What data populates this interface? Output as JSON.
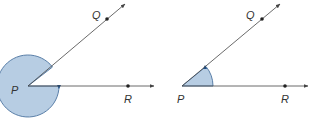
{
  "colors": {
    "fill": "#b7cde3",
    "stroke": "#5a7fa8",
    "line": "#444444",
    "arrow": "#1f4f86"
  },
  "figures": [
    {
      "name": "reflex-angle",
      "labels": {
        "vertex": "P",
        "upper": "Q",
        "lower": "R"
      }
    },
    {
      "name": "acute-angle",
      "labels": {
        "vertex": "P",
        "upper": "Q",
        "lower": "R"
      }
    }
  ]
}
